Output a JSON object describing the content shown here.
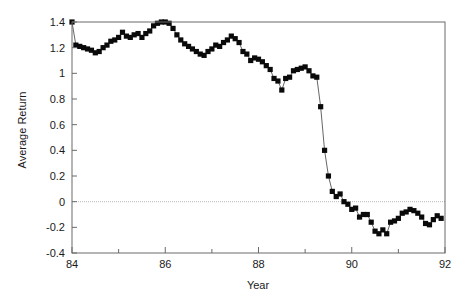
{
  "chart_data": {
    "type": "line",
    "title": "",
    "subtitle": "",
    "xlabel": "Year",
    "ylabel": "Average Return",
    "xlim": [
      84,
      92
    ],
    "ylim": [
      -0.4,
      1.4
    ],
    "xticks": [
      84,
      86,
      88,
      90,
      92
    ],
    "xtick_labels": [
      "84",
      "86",
      "88",
      "90",
      "92"
    ],
    "xminor_ticks": [
      85,
      87,
      89,
      91
    ],
    "yticks": [
      -0.4,
      -0.2,
      0,
      0.2,
      0.4,
      0.6,
      0.8,
      1,
      1.2,
      1.4
    ],
    "ytick_labels": [
      "-0.4",
      "-0.2",
      "0",
      "0.2",
      "0.4",
      "0.6",
      "0.8",
      "1",
      "1.2",
      "1.4"
    ],
    "grid": false,
    "reference_lines": [
      {
        "axis": "y",
        "value": 0,
        "style": "dotted"
      }
    ],
    "legend": null,
    "marker": "square",
    "marker_color": "#0a0a0a",
    "line_color": "#555555",
    "series": [
      {
        "name": "Average Return",
        "x": [
          84.0,
          84.083,
          84.167,
          84.25,
          84.333,
          84.417,
          84.5,
          84.583,
          84.667,
          84.75,
          84.833,
          84.917,
          85.0,
          85.083,
          85.167,
          85.25,
          85.333,
          85.417,
          85.5,
          85.583,
          85.667,
          85.75,
          85.833,
          85.917,
          86.0,
          86.083,
          86.167,
          86.25,
          86.333,
          86.417,
          86.5,
          86.583,
          86.667,
          86.75,
          86.833,
          86.917,
          87.0,
          87.083,
          87.167,
          87.25,
          87.333,
          87.417,
          87.5,
          87.583,
          87.667,
          87.75,
          87.833,
          87.917,
          88.0,
          88.083,
          88.167,
          88.25,
          88.333,
          88.417,
          88.5,
          88.583,
          88.667,
          88.75,
          88.833,
          88.917,
          89.0,
          89.083,
          89.167,
          89.25,
          89.333,
          89.417,
          89.5,
          89.583,
          89.667,
          89.75,
          89.833,
          89.917,
          90.0,
          90.083,
          90.167,
          90.25,
          90.333,
          90.417,
          90.5,
          90.583,
          90.667,
          90.75,
          90.833,
          90.917,
          91.0,
          91.083,
          91.167,
          91.25,
          91.333,
          91.417,
          91.5,
          91.583,
          91.667,
          91.75,
          91.833,
          91.917
        ],
        "values": [
          1.4,
          1.22,
          1.21,
          1.2,
          1.19,
          1.18,
          1.16,
          1.17,
          1.2,
          1.22,
          1.25,
          1.26,
          1.28,
          1.32,
          1.29,
          1.28,
          1.3,
          1.31,
          1.28,
          1.31,
          1.33,
          1.37,
          1.39,
          1.4,
          1.4,
          1.39,
          1.35,
          1.3,
          1.26,
          1.23,
          1.21,
          1.19,
          1.17,
          1.15,
          1.14,
          1.17,
          1.19,
          1.22,
          1.21,
          1.24,
          1.26,
          1.29,
          1.27,
          1.24,
          1.17,
          1.15,
          1.1,
          1.12,
          1.11,
          1.09,
          1.06,
          1.03,
          0.96,
          0.94,
          0.87,
          0.96,
          0.97,
          1.02,
          1.03,
          1.04,
          1.05,
          1.02,
          0.98,
          0.97,
          0.74,
          0.4,
          0.2,
          0.08,
          0.04,
          0.06,
          0.0,
          -0.02,
          -0.06,
          -0.05,
          -0.12,
          -0.1,
          -0.1,
          -0.16,
          -0.23,
          -0.25,
          -0.22,
          -0.25,
          -0.16,
          -0.15,
          -0.13,
          -0.09,
          -0.08,
          -0.06,
          -0.07,
          -0.09,
          -0.12,
          -0.17,
          -0.18,
          -0.14,
          -0.11,
          -0.13
        ]
      }
    ]
  },
  "axes": {
    "x_title": "Year",
    "y_title": "Average Return"
  }
}
